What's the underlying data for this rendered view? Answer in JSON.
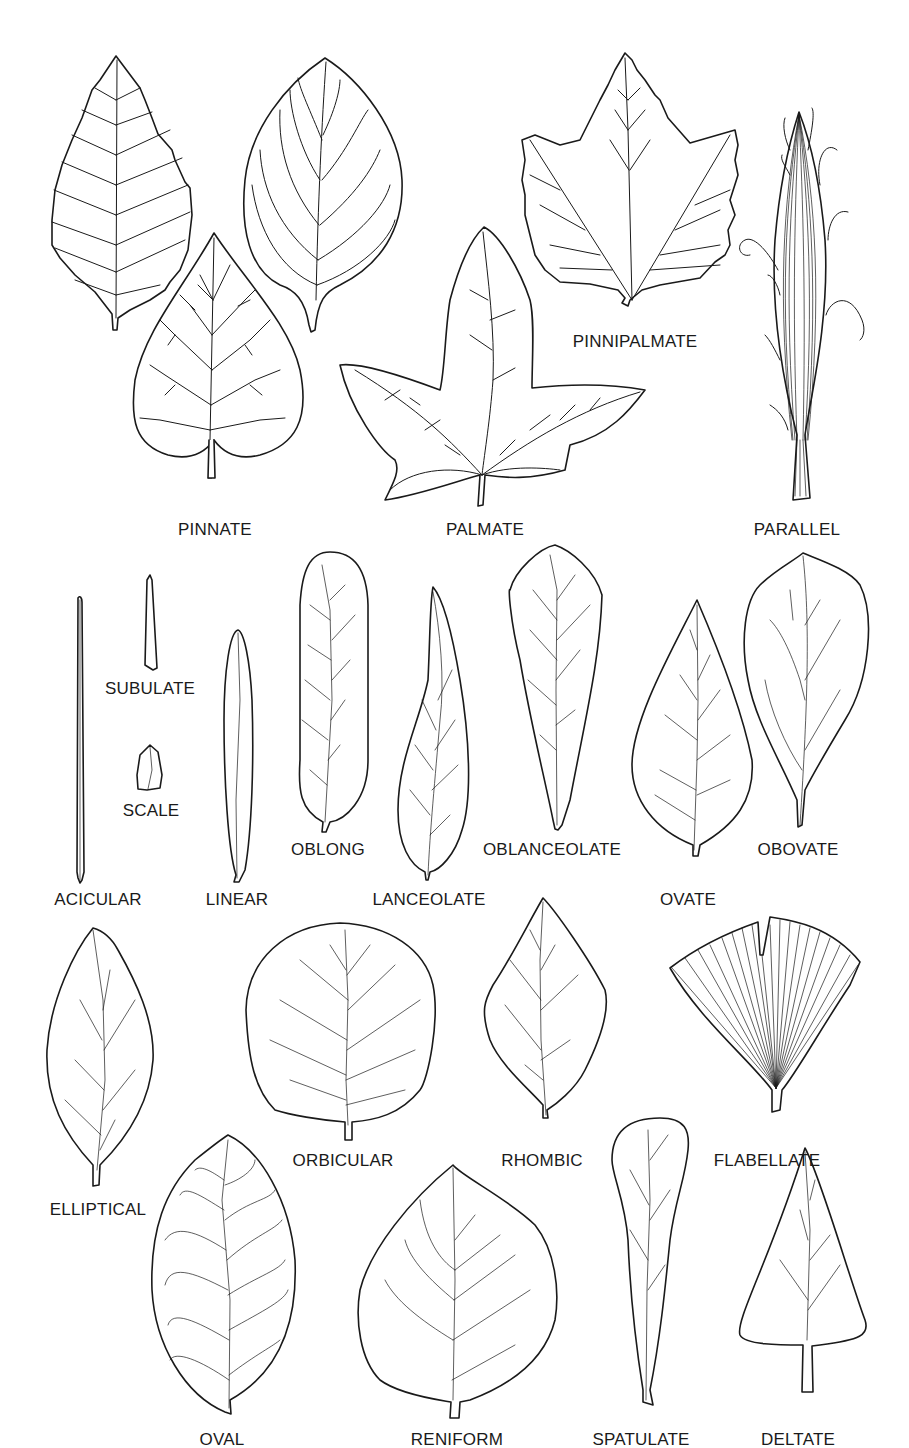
{
  "colors": {
    "line": "#1a1a1a",
    "background": "#ffffff"
  },
  "sections": {
    "venation": {
      "labels": [
        "PINNATE",
        "PALMATE",
        "PINNIPALMATE",
        "PARALLEL"
      ]
    },
    "shapes": {
      "labels": [
        "SUBULATE",
        "SCALE",
        "ACICULAR",
        "LINEAR",
        "OBLONG",
        "LANCEOLATE",
        "OBLANCEOLATE",
        "OVATE",
        "OBOVATE",
        "ELLIPTICAL",
        "ORBICULAR",
        "RHOMBIC",
        "FLABELLATE",
        "OVAL",
        "RENIFORM",
        "SPATULATE",
        "DELTATE"
      ]
    }
  },
  "labels": {
    "pinnate": "PINNATE",
    "palmate": "PALMATE",
    "pinnipalmate": "PINNIPALMATE",
    "parallel": "PARALLEL",
    "subulate": "SUBULATE",
    "scale": "SCALE",
    "acicular": "ACICULAR",
    "linear": "LINEAR",
    "oblong": "OBLONG",
    "lanceolate": "LANCEOLATE",
    "oblanceolate": "OBLANCEOLATE",
    "ovate": "OVATE",
    "obovate": "OBOVATE",
    "elliptical": "ELLIPTICAL",
    "orbicular": "ORBICULAR",
    "rhombic": "RHOMBIC",
    "flabellate": "FLABELLATE",
    "oval": "OVAL",
    "reniform": "RENIFORM",
    "spatulate": "SPATULATE",
    "deltate": "DELTATE"
  }
}
